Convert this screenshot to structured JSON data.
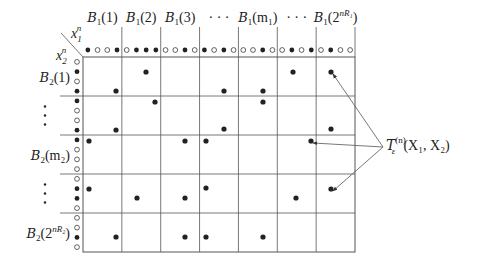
{
  "diagram": {
    "corner": {
      "row_var": "x",
      "row_var_sub": "2",
      "col_var": "x",
      "col_var_sub": "1",
      "exponent": "n"
    },
    "column_headers": [
      {
        "label": "B",
        "sub": "1",
        "arg": "(1)"
      },
      {
        "label": "B",
        "sub": "1",
        "arg": "(2)"
      },
      {
        "label": "B",
        "sub": "1",
        "arg": "(3)"
      },
      {
        "label": "· · ·",
        "sub": "",
        "arg": ""
      },
      {
        "label": "B",
        "sub": "1",
        "arg": "(m₁)"
      },
      {
        "label": "· · ·",
        "sub": "",
        "arg": ""
      },
      {
        "label": "B",
        "sub": "1",
        "arg": "(2^{nR₁})"
      }
    ],
    "column_header_text": [
      "𝓑₁(1)",
      "𝓑₁(2)",
      "𝓑₁(3)",
      "· · ·",
      "𝓑₁(m₁)",
      "· · ·",
      "𝓑₁(2ⁿᴿ¹)"
    ],
    "row_headers": [
      {
        "label": "B",
        "sub": "2",
        "arg": "(1)"
      },
      {
        "label": "⋮",
        "sub": "",
        "arg": ""
      },
      {
        "label": "B",
        "sub": "2",
        "arg": "(m₂)"
      },
      {
        "label": "⋮",
        "sub": "",
        "arg": ""
      },
      {
        "label": "B",
        "sub": "2",
        "arg": "(2^{nR₂})"
      }
    ],
    "row_header_text": [
      "𝓑₂(1)",
      "⋮",
      "𝓑₂(m₂)",
      "⋮",
      "𝓑₂(2ⁿᴿ²)"
    ],
    "column_sequence_markers": [
      [
        1,
        0,
        0,
        1
      ],
      [
        0,
        1,
        1,
        1
      ],
      [
        0,
        0,
        1,
        0
      ],
      [
        1,
        0,
        1,
        0
      ],
      [
        0,
        0,
        1,
        0
      ],
      [
        0,
        1,
        0,
        1
      ],
      [
        0,
        1,
        0,
        0
      ]
    ],
    "row_sequence_markers": [
      [
        0,
        1,
        0,
        1
      ],
      [
        1,
        0,
        0,
        1
      ],
      [
        1,
        0,
        0,
        0
      ],
      [
        0,
        1,
        1,
        0
      ],
      [
        0,
        0,
        1,
        0
      ]
    ],
    "typical_pairs": [
      {
        "row": 0,
        "col": 1,
        "x": 146,
        "y": 72
      },
      {
        "row": 0,
        "col": 0,
        "x": 116,
        "y": 91
      },
      {
        "row": 0,
        "col": 3,
        "x": 224,
        "y": 91
      },
      {
        "row": 0,
        "col": 4,
        "x": 263,
        "y": 91
      },
      {
        "row": 0,
        "col": 5,
        "x": 293,
        "y": 72
      },
      {
        "row": 0,
        "col": 6,
        "x": 331,
        "y": 72
      },
      {
        "row": 1,
        "col": 1,
        "x": 155,
        "y": 102
      },
      {
        "row": 1,
        "col": 4,
        "x": 263,
        "y": 102
      },
      {
        "row": 1,
        "col": 0,
        "x": 116,
        "y": 130
      },
      {
        "row": 1,
        "col": 3,
        "x": 224,
        "y": 129
      },
      {
        "row": 1,
        "col": 6,
        "x": 331,
        "y": 129
      },
      {
        "row": 2,
        "col": 0,
        "x": 89,
        "y": 141
      },
      {
        "row": 2,
        "col": 2,
        "x": 185,
        "y": 141
      },
      {
        "row": 2,
        "col": 3,
        "x": 206,
        "y": 141
      },
      {
        "row": 2,
        "col": 6,
        "x": 311,
        "y": 141
      },
      {
        "row": 3,
        "col": 0,
        "x": 89,
        "y": 189
      },
      {
        "row": 3,
        "col": 1,
        "x": 137,
        "y": 198
      },
      {
        "row": 3,
        "col": 2,
        "x": 185,
        "y": 198
      },
      {
        "row": 3,
        "col": 3,
        "x": 206,
        "y": 188
      },
      {
        "row": 3,
        "col": 5,
        "x": 296,
        "y": 198
      },
      {
        "row": 3,
        "col": 6,
        "x": 331,
        "y": 189
      },
      {
        "row": 4,
        "col": 0,
        "x": 116,
        "y": 237
      },
      {
        "row": 4,
        "col": 2,
        "x": 185,
        "y": 237
      },
      {
        "row": 4,
        "col": 3,
        "x": 206,
        "y": 237
      },
      {
        "row": 4,
        "col": 4,
        "x": 263,
        "y": 237
      }
    ],
    "annotation": {
      "symbol": "T",
      "sub": "ε",
      "sup": "(n)",
      "args": "(X₁, X₂)",
      "text": "𝒯ε⁽ⁿ⁾(X₁, X₂)",
      "arrow_targets": [
        {
          "x": 331,
          "y": 72
        },
        {
          "x": 311,
          "y": 141
        },
        {
          "x": 331,
          "y": 189
        }
      ]
    },
    "colors": {
      "line": "#555555",
      "dot": "#222222",
      "text": "#222222",
      "background": "#ffffff"
    }
  }
}
